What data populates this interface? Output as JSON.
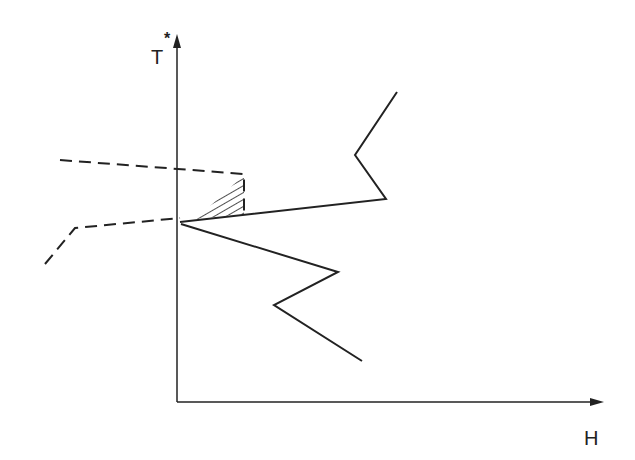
{
  "diagram": {
    "type": "line-sketch",
    "axes": {
      "y_label": "T",
      "y_label_superscript": "*",
      "x_label": "H",
      "origin": [
        177,
        402
      ],
      "y_axis_top": [
        177,
        40
      ],
      "x_axis_end": [
        601,
        402
      ]
    },
    "colors": {
      "ink": "#222222",
      "background": "#ffffff"
    },
    "solid_curves": [
      {
        "name": "upper-solid-curve",
        "points": [
          [
            180,
            222
          ],
          [
            386,
            199
          ],
          [
            355,
            155
          ],
          [
            397,
            92
          ]
        ]
      },
      {
        "name": "lower-solid-curve",
        "points": [
          [
            181,
            224
          ],
          [
            338,
            272
          ],
          [
            274,
            305
          ],
          [
            362,
            361
          ]
        ]
      }
    ],
    "dashed_curves": [
      {
        "name": "upper-dashed-curve",
        "points": [
          [
            60,
            160
          ],
          [
            244,
            174
          ],
          [
            244,
            214
          ]
        ]
      },
      {
        "name": "lower-dashed-curve",
        "points": [
          [
            45,
            264
          ],
          [
            75,
            228
          ],
          [
            180,
            218
          ]
        ]
      }
    ],
    "hatched_region": {
      "name": "hatched-region",
      "points": [
        [
          244,
          175
        ],
        [
          244,
          214
        ],
        [
          196,
          219
        ]
      ]
    }
  }
}
